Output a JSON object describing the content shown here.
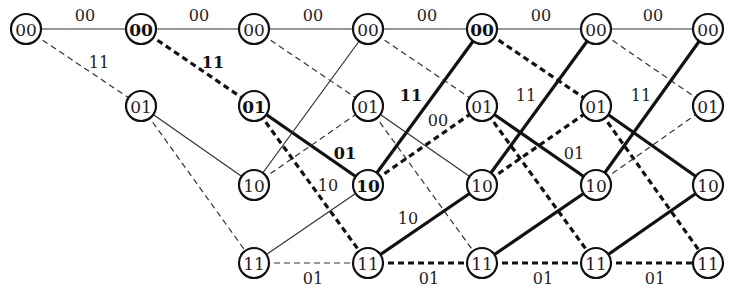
{
  "diagram": {
    "type": "trellis",
    "columns_x": [
      26,
      141,
      254,
      368,
      482,
      596,
      708
    ],
    "rows": {
      "00": 29,
      "01": 106,
      "10": 185,
      "11": 263
    },
    "node_radius": 15,
    "colors": {
      "stroke": "#111111",
      "thin": "#333333",
      "text": "#222222",
      "background": "#ffffff"
    },
    "nodes": [
      {
        "col": 0,
        "state": "00",
        "bold": false
      },
      {
        "col": 1,
        "state": "00",
        "bold": true
      },
      {
        "col": 1,
        "state": "01",
        "bold": false
      },
      {
        "col": 2,
        "state": "00",
        "bold": false
      },
      {
        "col": 2,
        "state": "01",
        "bold": true
      },
      {
        "col": 2,
        "state": "10",
        "bold": false
      },
      {
        "col": 2,
        "state": "11",
        "bold": false
      },
      {
        "col": 3,
        "state": "00",
        "bold": false
      },
      {
        "col": 3,
        "state": "01",
        "bold": false
      },
      {
        "col": 3,
        "state": "10",
        "bold": true
      },
      {
        "col": 3,
        "state": "11",
        "bold": false
      },
      {
        "col": 4,
        "state": "00",
        "bold": true
      },
      {
        "col": 4,
        "state": "01",
        "bold": false
      },
      {
        "col": 4,
        "state": "10",
        "bold": false
      },
      {
        "col": 4,
        "state": "11",
        "bold": false
      },
      {
        "col": 5,
        "state": "00",
        "bold": false
      },
      {
        "col": 5,
        "state": "01",
        "bold": false
      },
      {
        "col": 5,
        "state": "10",
        "bold": false
      },
      {
        "col": 5,
        "state": "11",
        "bold": false
      },
      {
        "col": 6,
        "state": "00",
        "bold": false
      },
      {
        "col": 6,
        "state": "01",
        "bold": false
      },
      {
        "col": 6,
        "state": "10",
        "bold": false
      },
      {
        "col": 6,
        "state": "11",
        "bold": false
      }
    ],
    "edges": [
      {
        "from": [
          0,
          "00"
        ],
        "to": [
          1,
          "00"
        ],
        "style": "solid",
        "weight": "thin"
      },
      {
        "from": [
          0,
          "00"
        ],
        "to": [
          1,
          "01"
        ],
        "style": "dashed",
        "weight": "thin"
      },
      {
        "from": [
          1,
          "00"
        ],
        "to": [
          2,
          "00"
        ],
        "style": "solid",
        "weight": "thin"
      },
      {
        "from": [
          1,
          "00"
        ],
        "to": [
          2,
          "01"
        ],
        "style": "dashed",
        "weight": "thick"
      },
      {
        "from": [
          1,
          "01"
        ],
        "to": [
          2,
          "10"
        ],
        "style": "solid",
        "weight": "thin"
      },
      {
        "from": [
          1,
          "01"
        ],
        "to": [
          2,
          "11"
        ],
        "style": "dashed",
        "weight": "thin"
      },
      {
        "from": [
          2,
          "00"
        ],
        "to": [
          3,
          "00"
        ],
        "style": "solid",
        "weight": "thin"
      },
      {
        "from": [
          2,
          "00"
        ],
        "to": [
          3,
          "01"
        ],
        "style": "dashed",
        "weight": "thin"
      },
      {
        "from": [
          2,
          "01"
        ],
        "to": [
          3,
          "10"
        ],
        "style": "solid",
        "weight": "thick"
      },
      {
        "from": [
          2,
          "01"
        ],
        "to": [
          3,
          "11"
        ],
        "style": "dashed",
        "weight": "thick"
      },
      {
        "from": [
          2,
          "10"
        ],
        "to": [
          3,
          "00"
        ],
        "style": "solid",
        "weight": "thin"
      },
      {
        "from": [
          2,
          "10"
        ],
        "to": [
          3,
          "01"
        ],
        "style": "dashed",
        "weight": "thin"
      },
      {
        "from": [
          2,
          "11"
        ],
        "to": [
          3,
          "10"
        ],
        "style": "solid",
        "weight": "thin"
      },
      {
        "from": [
          2,
          "11"
        ],
        "to": [
          3,
          "11"
        ],
        "style": "dashed",
        "weight": "thin"
      },
      {
        "from": [
          3,
          "00"
        ],
        "to": [
          4,
          "00"
        ],
        "style": "solid",
        "weight": "thin"
      },
      {
        "from": [
          3,
          "00"
        ],
        "to": [
          4,
          "01"
        ],
        "style": "dashed",
        "weight": "thin"
      },
      {
        "from": [
          3,
          "01"
        ],
        "to": [
          4,
          "10"
        ],
        "style": "solid",
        "weight": "thin"
      },
      {
        "from": [
          3,
          "01"
        ],
        "to": [
          4,
          "11"
        ],
        "style": "dashed",
        "weight": "thin"
      },
      {
        "from": [
          3,
          "10"
        ],
        "to": [
          4,
          "00"
        ],
        "style": "solid",
        "weight": "thick"
      },
      {
        "from": [
          3,
          "10"
        ],
        "to": [
          4,
          "01"
        ],
        "style": "dashed",
        "weight": "thick"
      },
      {
        "from": [
          3,
          "11"
        ],
        "to": [
          4,
          "10"
        ],
        "style": "solid",
        "weight": "thick"
      },
      {
        "from": [
          3,
          "11"
        ],
        "to": [
          4,
          "11"
        ],
        "style": "dashed",
        "weight": "thick"
      },
      {
        "from": [
          4,
          "00"
        ],
        "to": [
          5,
          "00"
        ],
        "style": "solid",
        "weight": "thin"
      },
      {
        "from": [
          4,
          "00"
        ],
        "to": [
          5,
          "01"
        ],
        "style": "dashed",
        "weight": "thick"
      },
      {
        "from": [
          4,
          "01"
        ],
        "to": [
          5,
          "10"
        ],
        "style": "solid",
        "weight": "thick"
      },
      {
        "from": [
          4,
          "01"
        ],
        "to": [
          5,
          "11"
        ],
        "style": "dashed",
        "weight": "thick"
      },
      {
        "from": [
          4,
          "10"
        ],
        "to": [
          5,
          "00"
        ],
        "style": "solid",
        "weight": "thick"
      },
      {
        "from": [
          4,
          "10"
        ],
        "to": [
          5,
          "01"
        ],
        "style": "dashed",
        "weight": "thick"
      },
      {
        "from": [
          4,
          "11"
        ],
        "to": [
          5,
          "10"
        ],
        "style": "solid",
        "weight": "thick"
      },
      {
        "from": [
          4,
          "11"
        ],
        "to": [
          5,
          "11"
        ],
        "style": "dashed",
        "weight": "thick"
      },
      {
        "from": [
          5,
          "00"
        ],
        "to": [
          6,
          "00"
        ],
        "style": "solid",
        "weight": "thin"
      },
      {
        "from": [
          5,
          "00"
        ],
        "to": [
          6,
          "01"
        ],
        "style": "dashed",
        "weight": "thin"
      },
      {
        "from": [
          5,
          "01"
        ],
        "to": [
          6,
          "10"
        ],
        "style": "solid",
        "weight": "thick"
      },
      {
        "from": [
          5,
          "01"
        ],
        "to": [
          6,
          "11"
        ],
        "style": "dashed",
        "weight": "thick"
      },
      {
        "from": [
          5,
          "10"
        ],
        "to": [
          6,
          "00"
        ],
        "style": "solid",
        "weight": "thick"
      },
      {
        "from": [
          5,
          "10"
        ],
        "to": [
          6,
          "01"
        ],
        "style": "dashed",
        "weight": "thin"
      },
      {
        "from": [
          5,
          "11"
        ],
        "to": [
          6,
          "10"
        ],
        "style": "solid",
        "weight": "thick"
      },
      {
        "from": [
          5,
          "11"
        ],
        "to": [
          6,
          "11"
        ],
        "style": "dashed",
        "weight": "thick"
      }
    ],
    "edge_labels": [
      {
        "text": "00",
        "x": 85,
        "y": 15,
        "bold": false
      },
      {
        "text": "00",
        "x": 199,
        "y": 15,
        "bold": false
      },
      {
        "text": "00",
        "x": 313,
        "y": 15,
        "bold": false
      },
      {
        "text": "00",
        "x": 427,
        "y": 15,
        "bold": false
      },
      {
        "text": "00",
        "x": 541,
        "y": 15,
        "bold": false
      },
      {
        "text": "00",
        "x": 653,
        "y": 15,
        "bold": false
      },
      {
        "text": "11",
        "x": 99,
        "y": 62,
        "bold": false
      },
      {
        "text": "11",
        "x": 213,
        "y": 62,
        "bold": true
      },
      {
        "text": "11",
        "x": 411,
        "y": 95,
        "bold": true
      },
      {
        "text": "11",
        "x": 526,
        "y": 95,
        "bold": false
      },
      {
        "text": "11",
        "x": 641,
        "y": 95,
        "bold": false
      },
      {
        "text": "00",
        "x": 438,
        "y": 120,
        "bold": false
      },
      {
        "text": "01",
        "x": 345,
        "y": 153,
        "bold": true
      },
      {
        "text": "01",
        "x": 574,
        "y": 153,
        "bold": false
      },
      {
        "text": "10",
        "x": 328,
        "y": 185,
        "bold": false
      },
      {
        "text": "10",
        "x": 408,
        "y": 218,
        "bold": false
      },
      {
        "text": "01",
        "x": 313,
        "y": 278,
        "bold": false
      },
      {
        "text": "01",
        "x": 429,
        "y": 278,
        "bold": false
      },
      {
        "text": "01",
        "x": 543,
        "y": 278,
        "bold": false
      },
      {
        "text": "01",
        "x": 655,
        "y": 278,
        "bold": false
      }
    ]
  }
}
